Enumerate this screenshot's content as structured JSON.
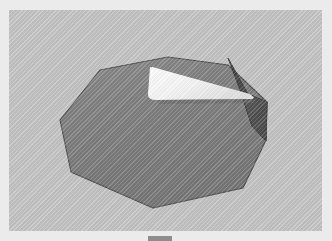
{
  "page": {
    "background_color": "#ebebeb",
    "canvas_background_color": "#c3c3c3"
  },
  "figure": {
    "name": "gray-faceted-blob",
    "colors": {
      "body_fill": "#7d7d7d",
      "body_fill_light": "#898989",
      "body_outline": "#4f4f4f",
      "wedge_fill": "#f7f7f7",
      "wedge_fill_shade": "#e2e2e2",
      "fold_dark": "#4a4a4a",
      "fold_dark_edge": "#3a3a3a",
      "fold_mid": "#5e5e5e",
      "backdrop": "#c3c3c3"
    },
    "parts": [
      {
        "label": "main body"
      },
      {
        "label": "white wedge"
      },
      {
        "label": "dark fold"
      },
      {
        "label": "shadow edge"
      }
    ]
  },
  "caption": {
    "mark_label": "clipped caption bar",
    "color": "#8d8d8d"
  }
}
